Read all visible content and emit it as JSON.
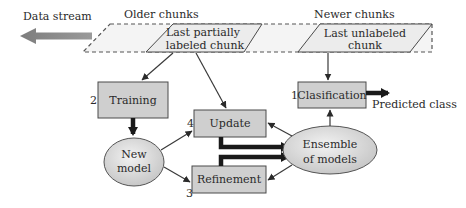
{
  "diagram": {
    "labels": {
      "data_stream": "Data stream",
      "older_chunks": "Older chunks",
      "newer_chunks": "Newer chunks",
      "predicted_class": "Predicted class"
    },
    "chunks": {
      "partially_labeled": {
        "line1": "Last partially",
        "line2": "labeled chunk"
      },
      "unlabeled": {
        "line1": "Last unlabeled",
        "line2": "chunk"
      }
    },
    "steps": {
      "classification": {
        "number": "1",
        "label": "Clasification"
      },
      "training": {
        "number": "2",
        "label": "Training"
      },
      "refinement": {
        "number": "3",
        "label": "Refinement"
      },
      "update": {
        "number": "4",
        "label": "Update"
      }
    },
    "models": {
      "new_model": {
        "line1": "New",
        "line2": "model"
      },
      "ensemble": {
        "line1": "Ensemble",
        "line2": "of models"
      }
    },
    "colors": {
      "box_fill": "#cfcfcf",
      "chunk_fill": "#ececec",
      "ellipse_fill": "#d8d8d8",
      "stream_arrow": "#8a8a8a",
      "stroke": "#4a4a4a"
    }
  }
}
